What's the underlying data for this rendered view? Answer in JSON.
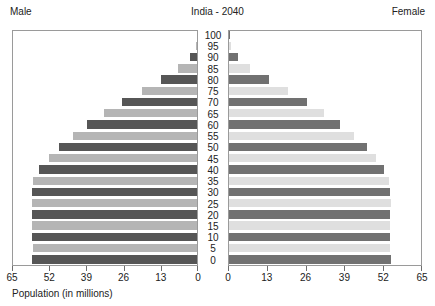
{
  "header": {
    "male_label": "Male",
    "female_label": "Female",
    "title": "India - 2040"
  },
  "axis": {
    "caption": "Population (in millions)",
    "male_ticks": [
      "65",
      "52",
      "39",
      "26",
      "13",
      "0"
    ],
    "female_ticks": [
      "0",
      "13",
      "26",
      "39",
      "52",
      "65"
    ],
    "max": 65
  },
  "colors": {
    "male_dark": "#565656",
    "male_light": "#b5b5b5",
    "female_dark": "#717171",
    "female_light": "#dfdfdf",
    "frame": "#9a9a9a",
    "text": "#222222"
  },
  "chart_data": {
    "type": "bar",
    "subtype": "population-pyramid",
    "title": "India - 2040",
    "xlabel": "Population (in millions)",
    "ylabel": "",
    "xlim": [
      0,
      65
    ],
    "grid": false,
    "legend": [
      "Male",
      "Female"
    ],
    "legend_position": "top-outside",
    "orientation": "horizontal",
    "categories": [
      "0",
      "5",
      "10",
      "15",
      "20",
      "25",
      "30",
      "35",
      "40",
      "45",
      "50",
      "55",
      "60",
      "65",
      "70",
      "75",
      "80",
      "85",
      "90",
      "95",
      "100"
    ],
    "series": [
      {
        "name": "Male",
        "side": "left",
        "values": [
          57.6,
          57.3,
          57.7,
          57.5,
          57.7,
          57.8,
          57.6,
          57.2,
          55.3,
          51.9,
          48.3,
          43.5,
          38.4,
          32.4,
          26.1,
          19.3,
          12.5,
          6.6,
          2.5,
          0.5,
          0.1
        ]
      },
      {
        "name": "Female",
        "side": "right",
        "values": [
          54.2,
          53.8,
          54.1,
          54.0,
          54.1,
          54.3,
          54.1,
          53.7,
          52.0,
          49.2,
          46.2,
          41.9,
          37.3,
          31.8,
          26.2,
          19.8,
          13.3,
          7.2,
          2.9,
          0.6,
          0.1
        ]
      }
    ]
  }
}
